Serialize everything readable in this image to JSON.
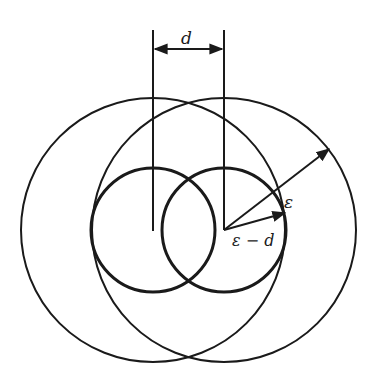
{
  "diagram": {
    "stroke_color": "#1a1a1a",
    "background": "#ffffff",
    "centers": [
      {
        "x": 153,
        "y": 230
      },
      {
        "x": 224,
        "y": 230
      }
    ],
    "large_radius": 132,
    "small_radius": 63,
    "labels": {
      "offset": "d",
      "outer_radius": "ε",
      "inner_radius": "ε − d"
    }
  }
}
